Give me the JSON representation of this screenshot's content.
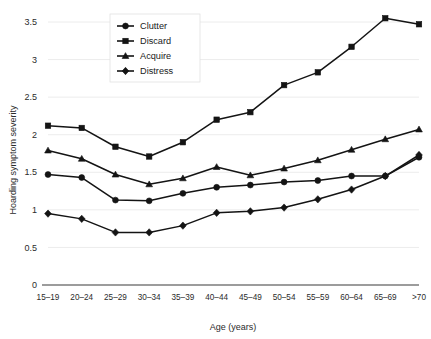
{
  "chart_data": {
    "type": "line",
    "title": "",
    "xlabel": "Age (years)",
    "ylabel": "Hoarding symptom severity",
    "categories": [
      "15–19",
      "20–24",
      "25–29",
      "30–34",
      "35–39",
      "40–44",
      "45–49",
      "50–54",
      "55–59",
      "60–64",
      "65–69",
      ">70"
    ],
    "ylim": [
      0,
      3.5
    ],
    "yticks": [
      0,
      0.5,
      1,
      1.5,
      2,
      2.5,
      3,
      3.5
    ],
    "ytick_labels": [
      "0",
      "0.5",
      "1",
      "1.5",
      "2",
      "2.5",
      "3",
      "3.5"
    ],
    "grid": true,
    "legend_position": "top-center",
    "series": [
      {
        "name": "Clutter",
        "marker": "circle",
        "values": [
          1.47,
          1.43,
          1.13,
          1.12,
          1.22,
          1.3,
          1.33,
          1.37,
          1.39,
          1.45,
          1.45,
          1.7
        ]
      },
      {
        "name": "Discard",
        "marker": "square",
        "values": [
          2.12,
          2.09,
          1.84,
          1.71,
          1.9,
          2.2,
          2.3,
          2.66,
          2.83,
          3.17,
          3.55,
          3.47
        ]
      },
      {
        "name": "Acquire",
        "marker": "triangle",
        "values": [
          1.79,
          1.68,
          1.47,
          1.34,
          1.42,
          1.57,
          1.46,
          1.55,
          1.66,
          1.8,
          1.94,
          2.07
        ]
      },
      {
        "name": "Distress",
        "marker": "diamond",
        "values": [
          0.95,
          0.88,
          0.7,
          0.7,
          0.79,
          0.96,
          0.98,
          1.03,
          1.14,
          1.27,
          1.45,
          1.73
        ]
      }
    ]
  },
  "legend": {
    "items": [
      {
        "label": "Clutter",
        "marker": "circle"
      },
      {
        "label": "Discard",
        "marker": "square"
      },
      {
        "label": "Acquire",
        "marker": "triangle"
      },
      {
        "label": "Distress",
        "marker": "diamond"
      }
    ]
  },
  "colors": {
    "ink": "#141414",
    "grid": "#ececec",
    "axis": "#3a3a3a",
    "background": "#ffffff"
  }
}
